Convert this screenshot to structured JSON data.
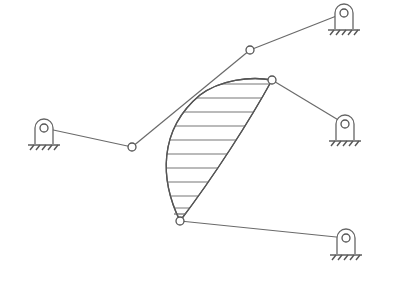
{
  "diagram": {
    "title": "",
    "type": "planar linkage mechanism with shaded coupler link",
    "colors": {
      "line": "#6a6a6a",
      "background": "#ffffff"
    },
    "ground_supports": [
      {
        "id": "support-left",
        "x": 44,
        "y": 128
      },
      {
        "id": "support-top-right",
        "x": 344,
        "y": 13
      },
      {
        "id": "support-mid-right",
        "x": 345,
        "y": 124
      },
      {
        "id": "support-bottom-right",
        "x": 346,
        "y": 238
      }
    ],
    "joints": [
      {
        "id": "joint-A",
        "x": 132,
        "y": 147
      },
      {
        "id": "joint-B",
        "x": 250,
        "y": 50
      },
      {
        "id": "joint-C",
        "x": 272,
        "y": 80
      },
      {
        "id": "joint-D",
        "x": 180,
        "y": 221
      }
    ],
    "links": [
      {
        "from": "support-left",
        "to": "joint-A"
      },
      {
        "from": "joint-A",
        "to": "joint-B"
      },
      {
        "from": "joint-B",
        "to": "support-top-right"
      },
      {
        "from": "joint-C",
        "to": "support-mid-right"
      },
      {
        "from": "joint-D",
        "to": "support-bottom-right"
      }
    ],
    "coupler": {
      "label": "",
      "vertices": [
        "joint-C",
        "joint-D"
      ],
      "hatched": true,
      "hatch_lines": 10
    }
  }
}
